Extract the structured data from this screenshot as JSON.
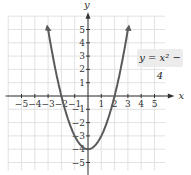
{
  "chart_data": {
    "type": "line",
    "title": "",
    "function": "y = x^2 - 4",
    "series": [
      {
        "name": "y = x² − 4",
        "x": [
          -3,
          -2.5,
          -2,
          -1.5,
          -1,
          -0.5,
          0,
          0.5,
          1,
          1.5,
          2,
          2.5,
          3
        ],
        "y": [
          5,
          2.25,
          0,
          -1.75,
          -3,
          -3.75,
          -4,
          -3.75,
          -3,
          -1.75,
          0,
          2.25,
          5
        ]
      }
    ],
    "xlabel": "x",
    "ylabel": "y",
    "xlim": [
      -6,
      6
    ],
    "ylim": [
      -6,
      6
    ],
    "x_ticks": [
      -5,
      -4,
      -3,
      -2,
      -1,
      1,
      2,
      3,
      4,
      5
    ],
    "y_ticks": [
      -5,
      -4,
      -3,
      -2,
      -1,
      1,
      2,
      3,
      4,
      5
    ],
    "grid": true,
    "annotation": "y = x² − 4",
    "color": "#5a5a5a"
  },
  "labels": {
    "x_axis": "x",
    "y_axis": "y",
    "equation": "y = x² − 4"
  }
}
